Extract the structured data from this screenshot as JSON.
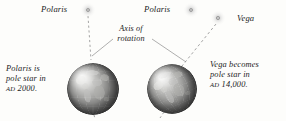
{
  "figure": {
    "background_color": "#fdfdfb",
    "ink_color": "#1b1b1b"
  },
  "stars": [
    {
      "id": "polaris-left",
      "label": "Polaris",
      "icon": "star-glow-icon",
      "x": 88,
      "y": 10,
      "label_x": 41,
      "label_y": 4
    },
    {
      "id": "polaris-right",
      "label": "Polaris",
      "icon": "star-glow-icon",
      "x": 191,
      "y": 10,
      "label_x": 144,
      "label_y": 4
    },
    {
      "id": "vega",
      "label": "Vega",
      "icon": "star-glow-icon",
      "x": 218,
      "y": 18,
      "label_x": 237,
      "label_y": 13
    }
  ],
  "axis_annotation": {
    "line1": "Axis of",
    "line2": "rotation"
  },
  "globes": [
    {
      "id": "earth-ad-2000",
      "cx": 93,
      "cy": 89,
      "r": 26,
      "axis_tilt_deg": 0,
      "pole_star": "Polaris",
      "caption": {
        "line1": "Polaris is",
        "line2": "pole star in",
        "era": "AD",
        "year": "2000."
      }
    },
    {
      "id": "earth-ad-14000",
      "cx": 172,
      "cy": 89,
      "r": 25,
      "axis_tilt_deg": 23,
      "pole_star": "Vega",
      "caption": {
        "line1": "Vega becomes",
        "line2": "pole star in",
        "era": "AD",
        "year": "14,000."
      }
    }
  ]
}
